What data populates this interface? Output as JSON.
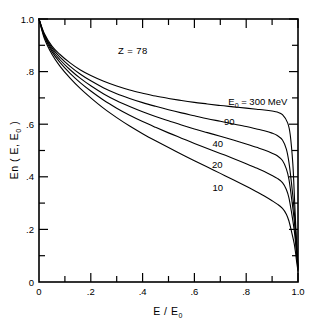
{
  "chart_data": {
    "type": "line",
    "title": "",
    "xlabel": "E / E0",
    "ylabel": "En ( E, E0 )",
    "xlim": [
      0,
      1.0
    ],
    "ylim": [
      0,
      1.0
    ],
    "grid": false,
    "legend_position": "inline-right",
    "annotations": [
      {
        "text": "Z = 78",
        "x": 0.34,
        "y": 0.9
      }
    ],
    "xticks": [
      0,
      0.1,
      0.2,
      0.3,
      0.4,
      0.5,
      0.6,
      0.7,
      0.8,
      0.9,
      1.0
    ],
    "xticklabels": [
      "0",
      "",
      ".2",
      "",
      ".4",
      "",
      ".6",
      "",
      ".8",
      "",
      "1.0"
    ],
    "yticks": [
      0,
      0.1,
      0.2,
      0.3,
      0.4,
      0.5,
      0.6,
      0.7,
      0.8,
      0.9,
      1.0
    ],
    "yticklabels": [
      "0",
      "",
      ".2",
      "",
      ".4",
      "",
      ".6",
      "",
      ".8",
      "",
      "1.0"
    ],
    "series": [
      {
        "name": "E0 = 300 MeV",
        "label": "E0 = 300 MeV",
        "label_at": {
          "x": 0.845,
          "y": 0.672
        },
        "x": [
          0.0,
          0.02,
          0.05,
          0.08,
          0.12,
          0.16,
          0.2,
          0.25,
          0.3,
          0.35,
          0.4,
          0.45,
          0.5,
          0.55,
          0.6,
          0.65,
          0.7,
          0.75,
          0.8,
          0.84,
          0.87,
          0.9,
          0.92,
          0.94,
          0.96,
          0.97,
          0.98,
          0.985,
          0.99,
          0.995,
          1.0
        ],
        "y": [
          1.0,
          0.946,
          0.897,
          0.866,
          0.833,
          0.806,
          0.785,
          0.763,
          0.745,
          0.73,
          0.718,
          0.707,
          0.698,
          0.69,
          0.683,
          0.677,
          0.671,
          0.666,
          0.661,
          0.657,
          0.654,
          0.65,
          0.646,
          0.636,
          0.605,
          0.56,
          0.45,
          0.35,
          0.24,
          0.14,
          0.06
        ]
      },
      {
        "name": "90",
        "label": "90",
        "label_at": {
          "x": 0.735,
          "y": 0.596
        },
        "x": [
          0.0,
          0.02,
          0.05,
          0.08,
          0.12,
          0.16,
          0.2,
          0.25,
          0.3,
          0.35,
          0.4,
          0.45,
          0.5,
          0.55,
          0.6,
          0.65,
          0.7,
          0.75,
          0.8,
          0.84,
          0.87,
          0.9,
          0.92,
          0.94,
          0.955,
          0.965,
          0.975,
          0.985,
          0.99,
          0.995,
          1.0
        ],
        "y": [
          1.0,
          0.942,
          0.89,
          0.856,
          0.82,
          0.79,
          0.765,
          0.738,
          0.716,
          0.698,
          0.682,
          0.668,
          0.655,
          0.643,
          0.632,
          0.621,
          0.611,
          0.601,
          0.591,
          0.582,
          0.575,
          0.566,
          0.557,
          0.54,
          0.505,
          0.455,
          0.375,
          0.275,
          0.21,
          0.13,
          0.055
        ]
      },
      {
        "name": "40",
        "label": "40",
        "label_at": {
          "x": 0.69,
          "y": 0.513
        },
        "x": [
          0.0,
          0.02,
          0.05,
          0.08,
          0.12,
          0.16,
          0.2,
          0.25,
          0.3,
          0.35,
          0.4,
          0.45,
          0.5,
          0.55,
          0.6,
          0.65,
          0.7,
          0.75,
          0.8,
          0.84,
          0.87,
          0.9,
          0.92,
          0.94,
          0.955,
          0.965,
          0.975,
          0.985,
          0.99,
          0.995,
          1.0
        ],
        "y": [
          1.0,
          0.938,
          0.883,
          0.846,
          0.807,
          0.774,
          0.746,
          0.715,
          0.689,
          0.667,
          0.647,
          0.629,
          0.613,
          0.597,
          0.582,
          0.568,
          0.554,
          0.54,
          0.525,
          0.512,
          0.502,
          0.49,
          0.48,
          0.462,
          0.43,
          0.39,
          0.32,
          0.24,
          0.18,
          0.115,
          0.05
        ]
      },
      {
        "name": "20",
        "label": "20",
        "label_at": {
          "x": 0.688,
          "y": 0.432
        },
        "x": [
          0.0,
          0.02,
          0.05,
          0.08,
          0.12,
          0.16,
          0.2,
          0.25,
          0.3,
          0.35,
          0.4,
          0.45,
          0.5,
          0.55,
          0.6,
          0.65,
          0.7,
          0.75,
          0.8,
          0.84,
          0.87,
          0.9,
          0.92,
          0.94,
          0.955,
          0.965,
          0.975,
          0.985,
          0.99,
          0.995,
          1.0
        ],
        "y": [
          1.0,
          0.934,
          0.876,
          0.836,
          0.793,
          0.757,
          0.726,
          0.691,
          0.661,
          0.634,
          0.61,
          0.588,
          0.567,
          0.547,
          0.527,
          0.508,
          0.489,
          0.47,
          0.45,
          0.433,
          0.42,
          0.405,
          0.394,
          0.378,
          0.352,
          0.32,
          0.265,
          0.2,
          0.155,
          0.1,
          0.048
        ]
      },
      {
        "name": "10",
        "label": "10",
        "label_at": {
          "x": 0.69,
          "y": 0.346
        },
        "x": [
          0.0,
          0.02,
          0.05,
          0.08,
          0.12,
          0.16,
          0.2,
          0.25,
          0.3,
          0.35,
          0.4,
          0.45,
          0.5,
          0.55,
          0.6,
          0.65,
          0.7,
          0.75,
          0.8,
          0.84,
          0.87,
          0.9,
          0.92,
          0.94,
          0.955,
          0.965,
          0.975,
          0.985,
          0.99,
          0.995,
          1.0
        ],
        "y": [
          1.0,
          0.928,
          0.866,
          0.822,
          0.775,
          0.735,
          0.7,
          0.66,
          0.625,
          0.593,
          0.564,
          0.537,
          0.511,
          0.486,
          0.461,
          0.437,
          0.413,
          0.389,
          0.364,
          0.343,
          0.327,
          0.309,
          0.296,
          0.28,
          0.258,
          0.232,
          0.192,
          0.148,
          0.115,
          0.075,
          0.042
        ]
      }
    ]
  },
  "axes": {
    "y_title_parts": {
      "main": "En ( E, E",
      "sub": "0",
      "tail": " )"
    },
    "x_title_parts": {
      "main": "E / E",
      "sub": "0"
    },
    "y_labels": [
      "1.0",
      ".8",
      ".6",
      ".4",
      ".2",
      "0"
    ],
    "x_labels": [
      "0",
      ".2",
      ".4",
      ".6",
      ".8",
      "1.0"
    ]
  },
  "annotation": {
    "z_label": "Z = 78"
  },
  "curve_labels": {
    "top": {
      "prefix": "E",
      "sub": "0",
      "value": "= 300 MeV"
    },
    "c90": "90",
    "c40": "40",
    "c20": "20",
    "c10": "10"
  }
}
